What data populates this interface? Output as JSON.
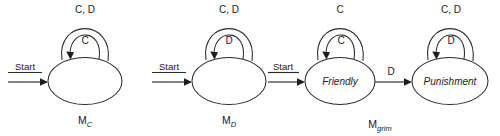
{
  "figure": {
    "type": "state-machine-diagram",
    "background_color": "#ffffff",
    "stroke_color": "#2b2b2b",
    "text_color": "#1a1a1a"
  },
  "machines": [
    {
      "id": "mc",
      "name_base": "M",
      "name_sub": "C",
      "start_label": "Start",
      "states": [
        {
          "id": "mc-s0",
          "label": "",
          "outer_loop_label": "C, D",
          "inner_loop_label": "C"
        }
      ],
      "transitions": []
    },
    {
      "id": "md",
      "name_base": "M",
      "name_sub": "D",
      "start_label": "Start",
      "states": [
        {
          "id": "md-s0",
          "label": "",
          "outer_loop_label": "C, D",
          "inner_loop_label": "D"
        }
      ],
      "transitions": []
    },
    {
      "id": "mgrim",
      "name_base": "M",
      "name_sub": "grim",
      "start_label": "Start",
      "states": [
        {
          "id": "grim-friendly",
          "label": "Friendly",
          "outer_loop_label": "C",
          "inner_loop_label": "C"
        },
        {
          "id": "grim-punishment",
          "label": "Punishment",
          "outer_loop_label": "C, D",
          "inner_loop_label": "D"
        }
      ],
      "transitions": [
        {
          "from": "grim-friendly",
          "to": "grim-punishment",
          "label": "D"
        }
      ]
    }
  ]
}
